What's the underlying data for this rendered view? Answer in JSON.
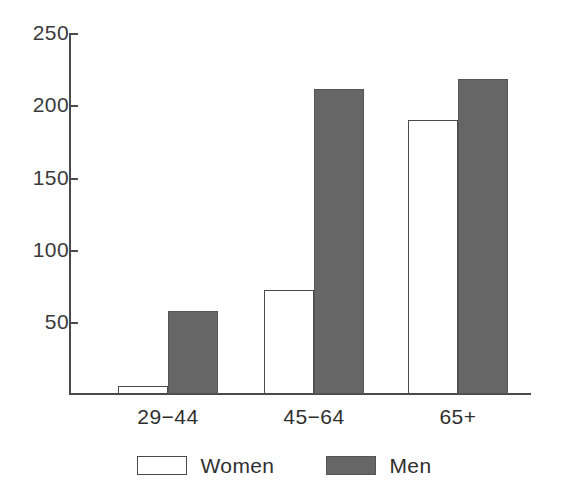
{
  "chart_data": {
    "type": "bar",
    "title": "",
    "subtitle": "",
    "xlabel": "",
    "ylabel": "",
    "categories": [
      "29−44",
      "45−64",
      "65+"
    ],
    "series": [
      {
        "name": "Women",
        "values": [
          6,
          72,
          190
        ],
        "color": "#ffffff"
      },
      {
        "name": "Men",
        "values": [
          58,
          211,
          218
        ],
        "color": "#666666"
      }
    ],
    "ylim": [
      0,
      250
    ],
    "yticks": [
      50,
      100,
      150,
      200,
      250
    ],
    "ytick_labels": [
      "50",
      "100",
      "150",
      "200",
      "250"
    ],
    "grid": false,
    "legend_position": "bottom",
    "legend_entries": [
      "Women",
      "Men"
    ],
    "axis_color": "#4a4a4a",
    "bar_outline_color": "#4a4a4a"
  },
  "legend": {
    "items": [
      {
        "label": "Women",
        "swatch": "legend-swatch-women"
      },
      {
        "label": "Men",
        "swatch": "legend-swatch-men"
      }
    ]
  }
}
